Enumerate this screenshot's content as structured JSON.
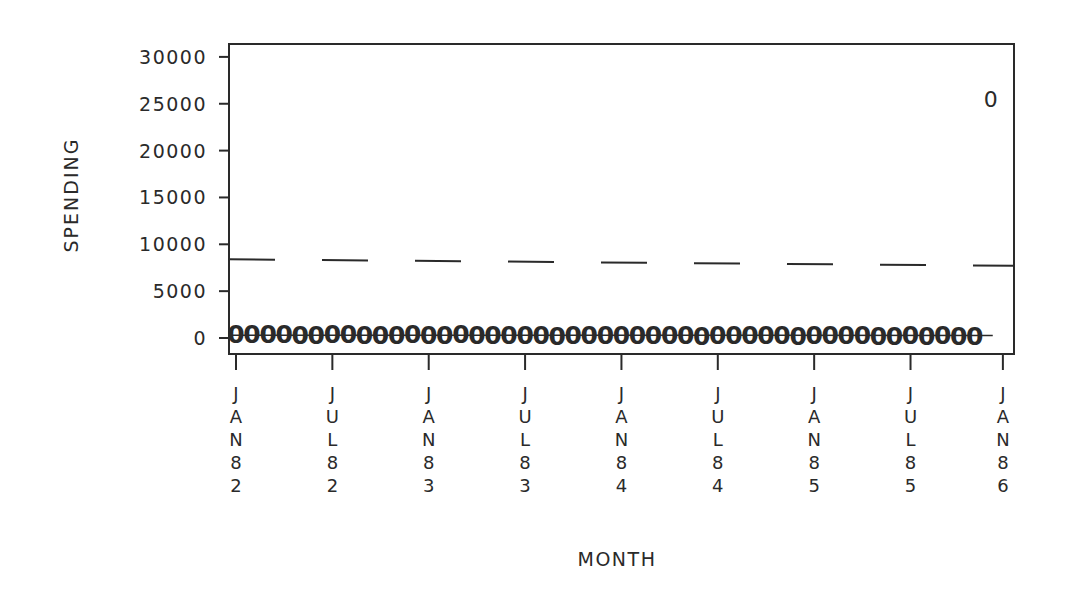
{
  "chart_data": {
    "type": "scatter",
    "title": "",
    "xlabel": "MONTH",
    "ylabel": "SPENDING",
    "ylim": [
      0,
      30000
    ],
    "yticks": [
      0,
      5000,
      10000,
      15000,
      20000,
      25000,
      30000
    ],
    "xtick_labels": [
      "JAN82",
      "JUL82",
      "JAN83",
      "JUL83",
      "JAN84",
      "JUL84",
      "JAN85",
      "JUL85",
      "JAN86"
    ],
    "grid": false,
    "legend": null,
    "marker_symbol": "0",
    "series": [
      {
        "name": "monthly spending",
        "style": "markers '0' with solid line",
        "x_start": "JAN82",
        "x_end": "NOV85",
        "values": [
          420,
          380,
          450,
          400,
          360,
          330,
          390,
          420,
          370,
          340,
          360,
          390,
          320,
          350,
          380,
          330,
          300,
          340,
          370,
          330,
          250,
          340,
          360,
          330,
          310,
          340,
          300,
          330,
          290,
          260,
          320,
          300,
          290,
          310,
          280,
          250,
          300,
          290,
          270,
          300,
          220,
          260,
          280,
          250,
          270,
          230,
          260
        ]
      },
      {
        "name": "outlier",
        "style": "marker '0'",
        "x": "DEC85",
        "value": 25500
      },
      {
        "name": "threshold",
        "style": "dashed line",
        "x_start": "JAN82",
        "x_end": "JAN86",
        "values_start_end": [
          8400,
          7700
        ]
      }
    ]
  },
  "labels": {
    "ylabel": "SPENDING",
    "xlabel": "MONTH",
    "marker": "0"
  }
}
